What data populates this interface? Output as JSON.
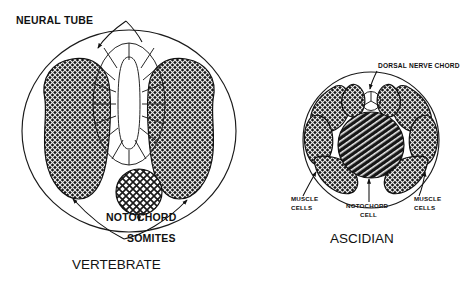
{
  "figure": {
    "type": "scientific-diagram",
    "background_color": "#ffffff",
    "ink_color": "#111111"
  },
  "panels": [
    {
      "id": "vertebrate",
      "title": "VERTEBRATE",
      "labels": [
        {
          "id": "neural-tube",
          "text": "NEURAL TUBE"
        },
        {
          "id": "notochord",
          "text": "NOTOCHORD"
        },
        {
          "id": "somites",
          "text": "SOMITES"
        }
      ],
      "structures": [
        {
          "name": "neural tube",
          "fill": "white",
          "cells": 14
        },
        {
          "name": "somite left",
          "fill": "dark-crosshatch"
        },
        {
          "name": "somite right",
          "fill": "dark-crosshatch"
        },
        {
          "name": "notochord",
          "fill": "light-crosshatch"
        },
        {
          "name": "body outline",
          "fill": "white"
        }
      ]
    },
    {
      "id": "ascidian",
      "title": "ASCIDIAN",
      "labels": [
        {
          "id": "dorsal-nerve-chord",
          "text": "DORSAL NERVE CHORD"
        },
        {
          "id": "muscle-cells-left",
          "text": "MUSCLE\nCELLS",
          "line1": "MUSCLE",
          "line2": "CELLS"
        },
        {
          "id": "muscle-cells-right",
          "text": "MUSCLE\nCELLS",
          "line1": "MUSCLE",
          "line2": "CELLS"
        },
        {
          "id": "notochord-cell",
          "text": "NOTOCHORD\nCELL",
          "line1": "NOTOCHORD",
          "line2": "CELL"
        }
      ],
      "structures": [
        {
          "name": "dorsal nerve chord",
          "fill": "white",
          "cells": 3
        },
        {
          "name": "muscle cells",
          "fill": "dark-crosshatch",
          "count": 8
        },
        {
          "name": "notochord cell",
          "fill": "diagonal-hatch"
        },
        {
          "name": "body outline",
          "fill": "white"
        }
      ]
    }
  ],
  "text": {
    "neural_tube": "NEURAL TUBE",
    "notochord": "NOTOCHORD",
    "somites": "SOMITES",
    "vertebrate": "VERTEBRATE",
    "dorsal_nerve_chord": "DORSAL NERVE CHORD",
    "muscle_line1": "MUSCLE",
    "muscle_line2": "CELLS",
    "notochord_cell_line1": "NOTOCHORD",
    "notochord_cell_line2": "CELL",
    "ascidian": "ASCIDIAN"
  }
}
